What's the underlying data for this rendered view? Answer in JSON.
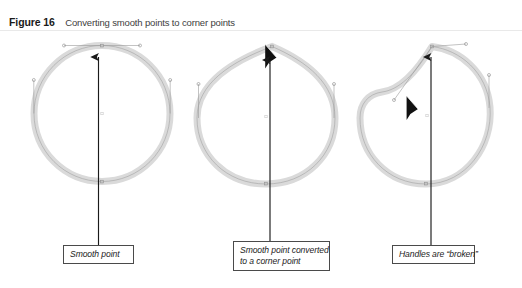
{
  "figure": {
    "label": "Figure 16",
    "caption": "Converting smooth points to corner points"
  },
  "colors": {
    "path_stroke": "#d9d9d9",
    "path_hairline": "#8f8f8f",
    "arrow": "#1a1a1a",
    "handle_line": "#9a9a9a",
    "box_border": "#4a4a4a",
    "caption_label": "#1a1a1a",
    "caption_text": "#3d3d3d",
    "background": "#ffffff",
    "rule": "#e9e9e9"
  },
  "panels": [
    {
      "id": "panel-smooth",
      "shape": "circle",
      "state": "smooth point",
      "cursor": "none",
      "callout": {
        "lines": [
          "Smooth point"
        ]
      }
    },
    {
      "id": "panel-converted",
      "shape": "teardrop",
      "state": "corner point",
      "cursor": "convert-point-cursor",
      "callout": {
        "lines": [
          "Smooth point converted",
          "to a corner point"
        ]
      }
    },
    {
      "id": "panel-broken",
      "shape": "broken-handle-blob",
      "state": "broken handles",
      "cursor": "convert-point-cursor",
      "callout": {
        "lines": [
          "Handles are “broken”"
        ]
      }
    }
  ],
  "callouts": {
    "smooth_point": "Smooth point",
    "converted_line1": "Smooth point converted",
    "converted_line2": "to a corner point",
    "broken": "Handles are “broken”"
  }
}
